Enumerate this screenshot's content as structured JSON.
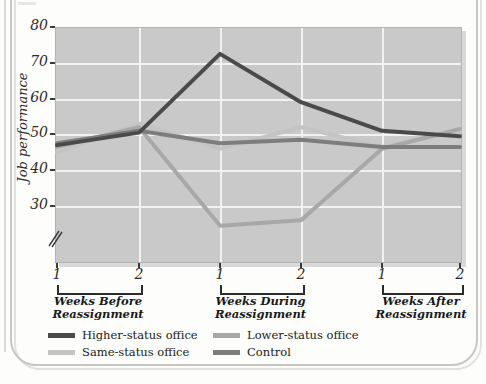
{
  "chart_data": {
    "type": "line",
    "title": "",
    "xlabel": "",
    "ylabel": "Job performance",
    "ylim": [
      22,
      80
    ],
    "ytick_labels": [
      "80",
      "70",
      "60",
      "50",
      "40",
      "30"
    ],
    "ytick_values": [
      80,
      70,
      60,
      50,
      40,
      30
    ],
    "axis_break": true,
    "grid": true,
    "legend_position": "bottom",
    "x": [
      1,
      2,
      1,
      2,
      1,
      2
    ],
    "xtick_labels": [
      "1",
      "2",
      "1",
      "2",
      "1",
      "2"
    ],
    "groups": [
      {
        "label": "Weeks Before\nReassignment",
        "start_index": 0,
        "end_index": 1
      },
      {
        "label": "Weeks During\nReassignment",
        "start_index": 2,
        "end_index": 3
      },
      {
        "label": "Weeks After\nReassignment",
        "start_index": 4,
        "end_index": 5
      }
    ],
    "series": [
      {
        "name": "Higher-status office",
        "color": "#4a4a4a",
        "values": [
          47.0,
          50.5,
          72.5,
          59.0,
          51.0,
          49.5
        ]
      },
      {
        "name": "Lower-status office",
        "color": "#a8a8a8",
        "values": [
          46.5,
          52.0,
          24.5,
          26.0,
          46.0,
          51.5
        ]
      },
      {
        "name": "Same-status office",
        "color": "#c4c4c4",
        "values": [
          45.0,
          53.0,
          46.0,
          52.0,
          46.5,
          51.0
        ]
      },
      {
        "name": "Control",
        "color": "#7d7d7d",
        "values": [
          47.5,
          51.0,
          47.5,
          48.5,
          46.5,
          46.5
        ]
      }
    ]
  },
  "legend": {
    "items": [
      {
        "label": "Higher-status office",
        "color": "#4a4a4a"
      },
      {
        "label": "Lower-status office",
        "color": "#a8a8a8"
      },
      {
        "label": "Same-status office",
        "color": "#c4c4c4"
      },
      {
        "label": "Control",
        "color": "#7d7d7d"
      }
    ]
  },
  "axes": {
    "y_title": "Job performance"
  },
  "colors": {
    "plot_background": "#c9c9c9",
    "gridline": "#f2f2f0",
    "text": "#1a1a1a"
  }
}
